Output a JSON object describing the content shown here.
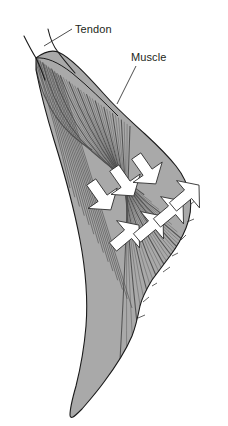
{
  "figure": {
    "background_color": "#ffffff"
  },
  "labels": [
    {
      "id": "tendon",
      "text": "Tendon",
      "x": 75,
      "y": 33,
      "leader_from": [
        72,
        29
      ],
      "leader_to": [
        44,
        46
      ]
    },
    {
      "id": "muscle",
      "text": "Muscle",
      "x": 131,
      "y": 61,
      "leader_from": [
        136,
        66
      ],
      "leader_to": [
        117,
        104
      ]
    }
  ],
  "structures": {
    "tendon": {
      "name": "tendon",
      "description": "narrow curved white band at superior aspect",
      "fill_color": "#ffffff",
      "stroke_color": "#1a1a1a"
    },
    "muscle_belly": {
      "name": "muscle-belly",
      "description": "gray fan-shaped pennate muscle belly with oblique fascicles",
      "fill_color": "#a9a9a9",
      "fiber_color": "#4a4a4a",
      "stroke_color": "#1a1a1a",
      "fiber_count": 34
    }
  },
  "force_arrows": {
    "name": "force-direction-arrows",
    "fill_color": "#ffffff",
    "stroke_color": "#2b2b2b",
    "count": 7,
    "groups": [
      {
        "id": "down-right-group",
        "direction": "down-right",
        "angle_deg": 55,
        "count": 3,
        "arrows": [
          {
            "id": "arrow-dr-1",
            "cx": 101,
            "cy": 196,
            "len": 34,
            "w": 11
          },
          {
            "id": "arrow-dr-2",
            "cx": 124,
            "cy": 182,
            "len": 34,
            "w": 11
          },
          {
            "id": "arrow-dr-3",
            "cx": 146,
            "cy": 170,
            "len": 34,
            "w": 11
          }
        ]
      },
      {
        "id": "up-right-group",
        "direction": "up-right",
        "angle_deg": -40,
        "count": 4,
        "arrows": [
          {
            "id": "arrow-ur-1",
            "cx": 126,
            "cy": 236,
            "len": 34,
            "w": 11
          },
          {
            "id": "arrow-ur-2",
            "cx": 150,
            "cy": 227,
            "len": 34,
            "w": 11
          },
          {
            "id": "arrow-ur-3",
            "cx": 170,
            "cy": 212,
            "len": 34,
            "w": 11
          },
          {
            "id": "arrow-ur-4",
            "cx": 186,
            "cy": 196,
            "len": 34,
            "w": 11
          }
        ]
      }
    ]
  },
  "colors": {
    "background": "#ffffff",
    "muscle_fill": "#a9a9a9",
    "fiber_line": "#4a4a4a",
    "outline": "#1a1a1a",
    "text": "#231f20",
    "arrow_fill": "#ffffff",
    "arrow_stroke": "#2b2b2b"
  }
}
